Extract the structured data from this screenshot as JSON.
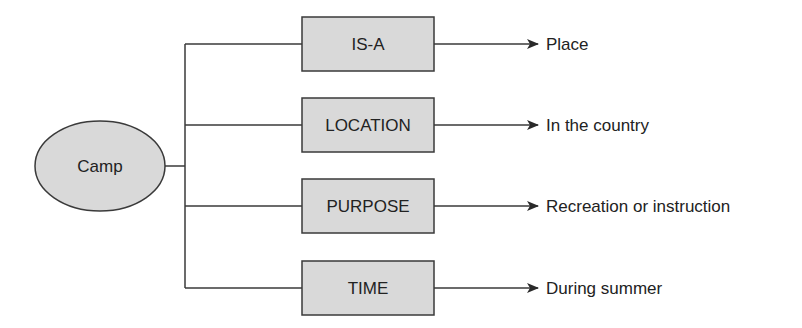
{
  "diagram": {
    "colors": {
      "node_fill": "#d9d9d9",
      "stroke": "#3a3a3a",
      "text": "#222222",
      "background": "#ffffff"
    },
    "root": {
      "label": "Camp",
      "shape": "ellipse"
    },
    "slots": [
      {
        "relation": "IS-A",
        "value": "Place"
      },
      {
        "relation": "LOCATION",
        "value": "In the country"
      },
      {
        "relation": "PURPOSE",
        "value": "Recreation or instruction"
      },
      {
        "relation": "TIME",
        "value": "During summer"
      }
    ]
  }
}
